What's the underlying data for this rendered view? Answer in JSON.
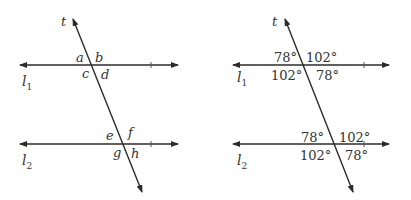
{
  "diagrams": [
    {
      "name": "unknown-angles",
      "transversal_label": "t",
      "lines": [
        {
          "label": "l",
          "subscript": "1"
        },
        {
          "label": "l",
          "subscript": "2"
        }
      ],
      "angles_l1": {
        "top_left": "a",
        "top_right": "b",
        "bottom_left": "c",
        "bottom_right": "d"
      },
      "angles_l2": {
        "top_left": "e",
        "top_right": "f",
        "bottom_left": "g",
        "bottom_right": "h"
      }
    },
    {
      "name": "known-angles",
      "transversal_label": "t",
      "lines": [
        {
          "label": "l",
          "subscript": "1"
        },
        {
          "label": "l",
          "subscript": "2"
        }
      ],
      "angles_l1": {
        "top_left": "78°",
        "top_right": "102°",
        "bottom_left": "102°",
        "bottom_right": "78°"
      },
      "angles_l2": {
        "top_left": "78°",
        "top_right": "102°",
        "bottom_left": "102°",
        "bottom_right": "78°"
      }
    }
  ],
  "colors": {
    "stroke": "#2b2b2b",
    "text": "#333333",
    "background": "#ffffff"
  }
}
